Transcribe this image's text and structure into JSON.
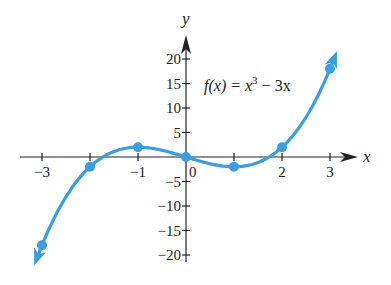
{
  "chart_data": {
    "type": "line",
    "title": "",
    "annotation": "f(x) = x^3 - 3x",
    "annotation_parts": {
      "lhs": "f(x) = ",
      "base": "x",
      "exp": "3",
      "rest": " − 3x"
    },
    "xlabel": "x",
    "ylabel": "y",
    "xlim": [
      -3.5,
      3.6
    ],
    "ylim": [
      -21,
      24
    ],
    "x_ticks": [
      -3,
      -2,
      -1,
      0,
      1,
      2,
      3
    ],
    "x_tick_labels": [
      {
        "value": -3,
        "label": "−3"
      },
      {
        "value": -1,
        "label": "−1"
      },
      {
        "value": 0,
        "label": "0"
      },
      {
        "value": 2,
        "label": "2"
      },
      {
        "value": 3,
        "label": "3"
      }
    ],
    "y_ticks": [
      -20,
      -15,
      -10,
      -5,
      5,
      10,
      15,
      20
    ],
    "y_tick_labels": [
      {
        "value": 20,
        "label": "20"
      },
      {
        "value": 15,
        "label": "15"
      },
      {
        "value": 10,
        "label": "10"
      },
      {
        "value": 5,
        "label": "5"
      },
      {
        "value": -5,
        "label": "−5"
      },
      {
        "value": -10,
        "label": "−10"
      },
      {
        "value": -15,
        "label": "−15"
      },
      {
        "value": -20,
        "label": "−20"
      }
    ],
    "grid": false,
    "series": [
      {
        "name": "f(x) = x^3 - 3x",
        "color": "#3a9ee0",
        "x": [
          -3,
          -2,
          -1,
          0,
          1,
          2,
          3
        ],
        "values": [
          -18,
          -2,
          2,
          0,
          -2,
          2,
          18
        ],
        "arrows_at_ends": true
      }
    ]
  },
  "colors": {
    "curve": "#3a9ee0",
    "axis": "#222222",
    "background": "#ffffff"
  }
}
